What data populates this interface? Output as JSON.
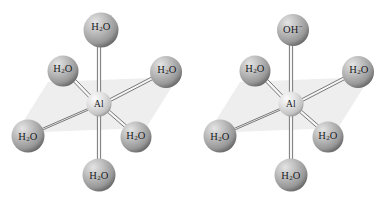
{
  "figure": {
    "background_color": "#ffffff",
    "width": 385,
    "height": 204
  },
  "palette": {
    "ligand_sphere_light": "#d8d8d8",
    "ligand_sphere_mid": "#a9a9a9",
    "ligand_sphere_dark": "#6e6e6e",
    "center_sphere_light": "#f2f2f2",
    "center_sphere_mid": "#d4d4d4",
    "center_sphere_dark": "#8e8e8e",
    "bond_edge": "#5d5d5d",
    "bond_fill": "#f4f4f4",
    "plane_fill": "#eeeeee",
    "label_color": "#15161a"
  },
  "structures": [
    {
      "id": "hexaaqua-aluminium",
      "center": {
        "label": "Al",
        "x": 99,
        "y": 104,
        "r": 12.5
      },
      "plane": {
        "points": "48,82 178,77 146,128 16,133"
      },
      "ligands": [
        {
          "position": "top",
          "label_html": "H<sub>2</sub>O",
          "formula": "H2O",
          "x": 101,
          "y": 30,
          "r": 17.5,
          "label_x": 101,
          "label_y": 27
        },
        {
          "position": "upper-left",
          "label_html": "H<sub>2</sub>O",
          "formula": "H2O",
          "x": 63,
          "y": 71,
          "r": 15.5,
          "label_x": 63,
          "label_y": 69
        },
        {
          "position": "upper-right",
          "label_html": "H<sub>2</sub>O",
          "formula": "H2O",
          "x": 166,
          "y": 72,
          "r": 16,
          "label_x": 167,
          "label_y": 70
        },
        {
          "position": "lower-left",
          "label_html": "H<sub>2</sub>O",
          "formula": "H2O",
          "x": 28,
          "y": 136,
          "r": 16.5,
          "label_x": 28,
          "label_y": 137
        },
        {
          "position": "lower-right",
          "label_html": "H<sub>2</sub>O",
          "formula": "H2O",
          "x": 136,
          "y": 137,
          "r": 15.5,
          "label_x": 136,
          "label_y": 136
        },
        {
          "position": "bottom",
          "label_html": "H<sub>2</sub>O",
          "formula": "H2O",
          "x": 99,
          "y": 175,
          "r": 16.5,
          "label_x": 99,
          "label_y": 176
        }
      ]
    },
    {
      "id": "pentaaqua-hydroxido-aluminium",
      "center": {
        "label": "Al",
        "x": 99,
        "y": 104,
        "r": 12.5
      },
      "plane": {
        "points": "48,82 178,77 146,128 16,133"
      },
      "ligands": [
        {
          "position": "top",
          "label_html": "OH<sup>&minus;</sup>",
          "formula": "OH-",
          "x": 101,
          "y": 30,
          "r": 16,
          "label_x": 101,
          "label_y": 28
        },
        {
          "position": "upper-left",
          "label_html": "H<sub>2</sub>O",
          "formula": "H2O",
          "x": 63,
          "y": 71,
          "r": 15.5,
          "label_x": 63,
          "label_y": 69
        },
        {
          "position": "upper-right",
          "label_html": "H<sub>2</sub>O",
          "formula": "H2O",
          "x": 166,
          "y": 72,
          "r": 16,
          "label_x": 167,
          "label_y": 70
        },
        {
          "position": "lower-left",
          "label_html": "H<sub>2</sub>O",
          "formula": "H2O",
          "x": 28,
          "y": 136,
          "r": 16.5,
          "label_x": 28,
          "label_y": 137
        },
        {
          "position": "lower-right",
          "label_html": "H<sub>2</sub>O",
          "formula": "H2O",
          "x": 136,
          "y": 137,
          "r": 15.5,
          "label_x": 136,
          "label_y": 136
        },
        {
          "position": "bottom",
          "label_html": "H<sub>2</sub>O",
          "formula": "H2O",
          "x": 99,
          "y": 175,
          "r": 16.5,
          "label_x": 99,
          "label_y": 176
        }
      ]
    }
  ]
}
